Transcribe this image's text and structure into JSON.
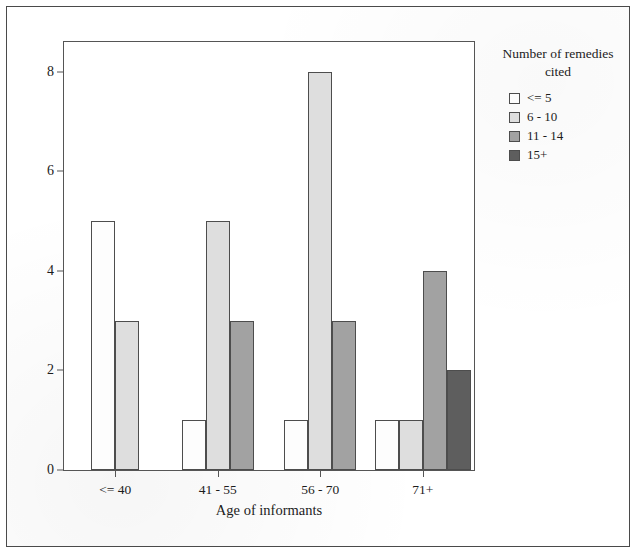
{
  "chart_data": {
    "type": "bar",
    "title": "",
    "subtitle": "",
    "xlabel": "Age of informants",
    "ylabel": "",
    "categories": [
      "<= 40",
      "41 - 55",
      "56 - 70",
      "71+"
    ],
    "series": [
      {
        "name": "<= 5",
        "values": [
          5,
          1,
          1,
          1
        ],
        "color": "#fdfdfd"
      },
      {
        "name": "6 - 10",
        "values": [
          3,
          5,
          8,
          1
        ],
        "color": "#dedede"
      },
      {
        "name": "11 - 14",
        "values": [
          0,
          3,
          3,
          4
        ],
        "color": "#a2a2a2"
      },
      {
        "name": "15+",
        "values": [
          0,
          0,
          0,
          2
        ],
        "color": "#5e5e5e"
      }
    ],
    "ylim": [
      0,
      8.6
    ],
    "yticks": [
      0,
      2,
      4,
      6,
      8
    ],
    "ytick_labels": [
      "0",
      "2",
      "4",
      "6",
      "8"
    ],
    "grid": false,
    "legend_position": "right",
    "legend_title": "Number of remedies\ncited"
  },
  "legend": {
    "title": "Number of remedies\ncited",
    "items": [
      {
        "label": "<= 5"
      },
      {
        "label": "6 - 10"
      },
      {
        "label": "11 - 14"
      },
      {
        "label": "15+"
      }
    ]
  },
  "axes": {
    "x_title": "Age of informants",
    "x_tick_labels": [
      "<= 40",
      "41 - 55",
      "56 - 70",
      "71+"
    ],
    "y_tick_labels": [
      "0",
      "2",
      "4",
      "6",
      "8"
    ]
  },
  "colors": {
    "series_1": "#fdfdfd",
    "series_2": "#dedede",
    "series_3": "#a2a2a2",
    "series_4": "#5e5e5e",
    "axis": "#555555",
    "text": "#1c1c1c",
    "page_border": "#4a4a4a"
  }
}
